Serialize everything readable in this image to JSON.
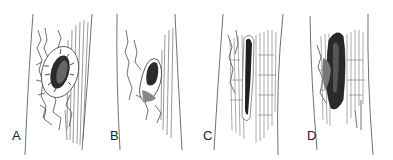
{
  "figure": {
    "panels": [
      {
        "label": "A",
        "description": "circular canker with callus ring and dark center on bark"
      },
      {
        "label": "B",
        "description": "irregular canker with dark cavity and shading"
      },
      {
        "label": "C",
        "description": "elongated narrow dark vertical lesion in fissured bark"
      },
      {
        "label": "D",
        "description": "large dark elongated lesion with broken bark"
      }
    ]
  }
}
